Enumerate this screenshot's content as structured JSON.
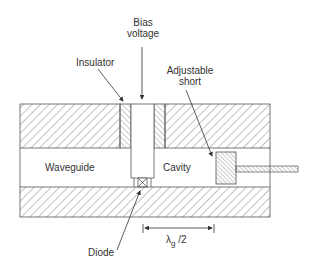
{
  "diagram": {
    "labels": {
      "bias_voltage_line1": "Bias",
      "bias_voltage_line2": "voltage",
      "insulator": "Insulator",
      "adjustable_short_line1": "Adjustable",
      "adjustable_short_line2": "short",
      "waveguide": "Waveguide",
      "cavity": "Cavity",
      "diode": "Diode",
      "lambda_symbol": "λ",
      "lambda_subscript": "g",
      "lambda_suffix": " /2"
    },
    "colors": {
      "line": "#555555",
      "text": "#333333",
      "background": "#ffffff"
    }
  }
}
